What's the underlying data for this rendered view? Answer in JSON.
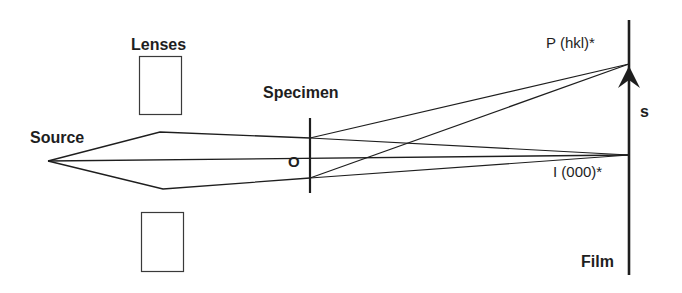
{
  "diagram": {
    "type": "ray-optics-diagram",
    "labels": {
      "lenses": "Lenses",
      "source": "Source",
      "specimen": "Specimen",
      "origin": "O",
      "diffraction_point": "P (hkl)*",
      "direct_beam_point": "I (000)*",
      "vector": "s",
      "film": "Film"
    },
    "colors": {
      "line": "#1e1e1e",
      "lens_outline": "#3a3a3a",
      "background": "#ffffff"
    }
  }
}
